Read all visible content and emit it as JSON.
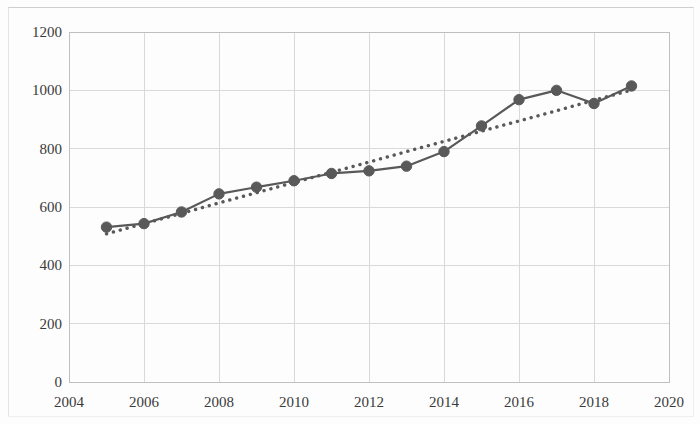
{
  "chart_data": {
    "type": "line",
    "title": "",
    "subtitle": "",
    "xlabel": "",
    "ylabel": "",
    "x": [
      2005,
      2006,
      2007,
      2008,
      2009,
      2010,
      2011,
      2012,
      2013,
      2014,
      2015,
      2016,
      2017,
      2018,
      2019
    ],
    "series": [
      {
        "name": "data",
        "style": "solid-line-with-round-markers",
        "color": "#595959",
        "values": [
          531,
          543,
          583,
          645,
          668,
          690,
          715,
          724,
          740,
          790,
          878,
          968,
          1000,
          955,
          1015
        ]
      },
      {
        "name": "trendline",
        "style": "dotted",
        "color": "#595959",
        "values": [
          508,
          543,
          578,
          614,
          649,
          684,
          719,
          754,
          790,
          825,
          860,
          895,
          930,
          966,
          1001
        ]
      }
    ],
    "xlim": [
      2004,
      2020
    ],
    "ylim": [
      0,
      1200
    ],
    "x_ticks": [
      "2004",
      "2006",
      "2008",
      "2010",
      "2012",
      "2014",
      "2016",
      "2018",
      "2020"
    ],
    "x_tick_values": [
      2004,
      2006,
      2008,
      2010,
      2012,
      2014,
      2016,
      2018,
      2020
    ],
    "y_ticks": [
      "0",
      "200",
      "400",
      "600",
      "800",
      "1000",
      "1200"
    ],
    "y_tick_values": [
      0,
      200,
      400,
      600,
      800,
      1000,
      1200
    ],
    "grid": {
      "horizontal": true,
      "vertical": true,
      "color": "#d9d9d9"
    },
    "legend": {
      "visible": false,
      "position": "none",
      "entries": []
    },
    "plot_area": {
      "left": 69,
      "right": 669,
      "top": 32,
      "bottom": 382
    },
    "colors": {
      "line": "#595959",
      "marker": "#595959",
      "trendline": "#595959",
      "grid": "#d9d9d9",
      "axis": "#bfbfbf",
      "text": "#3a3a3a",
      "background": "#fdfdfd"
    }
  }
}
